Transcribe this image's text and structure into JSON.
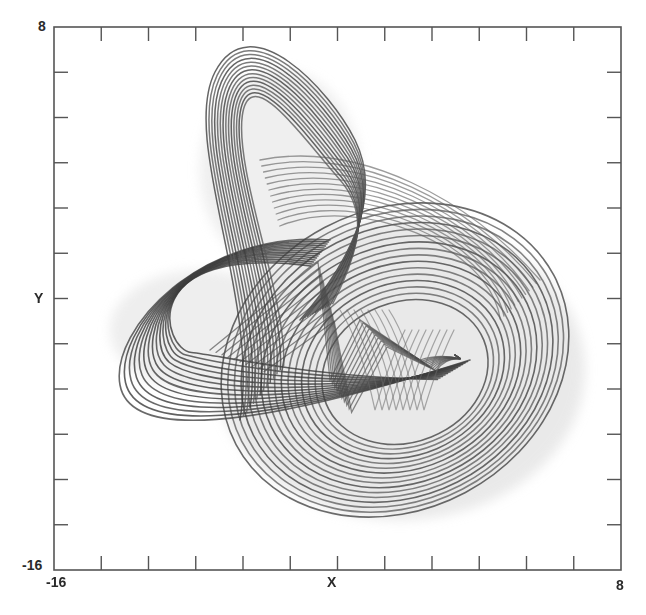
{
  "chart_data": {
    "type": "line",
    "title": "",
    "xlabel": "X",
    "ylabel": "Y",
    "xlim": [
      -16,
      8
    ],
    "ylim": [
      -16,
      8
    ],
    "x_tick_labels": [
      "-16",
      "8"
    ],
    "y_tick_labels": [
      "8",
      "-16"
    ],
    "x_ticks": [
      -16,
      -14,
      -12,
      -10,
      -8,
      -6,
      -4,
      -2,
      0,
      2,
      4,
      6,
      8
    ],
    "y_ticks": [
      -16,
      -14,
      -12,
      -10,
      -8,
      -6,
      -4,
      -2,
      0,
      2,
      4,
      6,
      8
    ],
    "grid": false,
    "legend": null,
    "series": [
      {
        "name": "trajectory",
        "approx_extent": {
          "x": [
            -14.2,
            6.4
          ],
          "y": [
            -13.4,
            5.9
          ]
        },
        "lobes": [
          {
            "name": "upper-left fold",
            "x_range": [
              -9.5,
              -3.0
            ],
            "y_range": [
              -2.0,
              5.9
            ]
          },
          {
            "name": "left loop",
            "x_range": [
              -14.2,
              -5.0
            ],
            "y_range": [
              -7.0,
              1.0
            ]
          },
          {
            "name": "large right loop",
            "x_range": [
              -10.0,
              6.4
            ],
            "y_range": [
              -13.4,
              2.0
            ]
          },
          {
            "name": "central spikes",
            "x_range": [
              -4.5,
              -2.0
            ],
            "y_range": [
              -7.5,
              1.8
            ]
          }
        ]
      }
    ],
    "colors": {
      "trajectory": "#5a5a5a",
      "trajectory_dark": "#3a3a3a",
      "halo": "#c8c8c8",
      "axis": "#555555"
    }
  },
  "axes": {
    "x_min_label": "-16",
    "x_max_label": "8",
    "y_max_label": "8",
    "y_min_label": "-16",
    "x_title": "X",
    "y_title": "Y"
  }
}
